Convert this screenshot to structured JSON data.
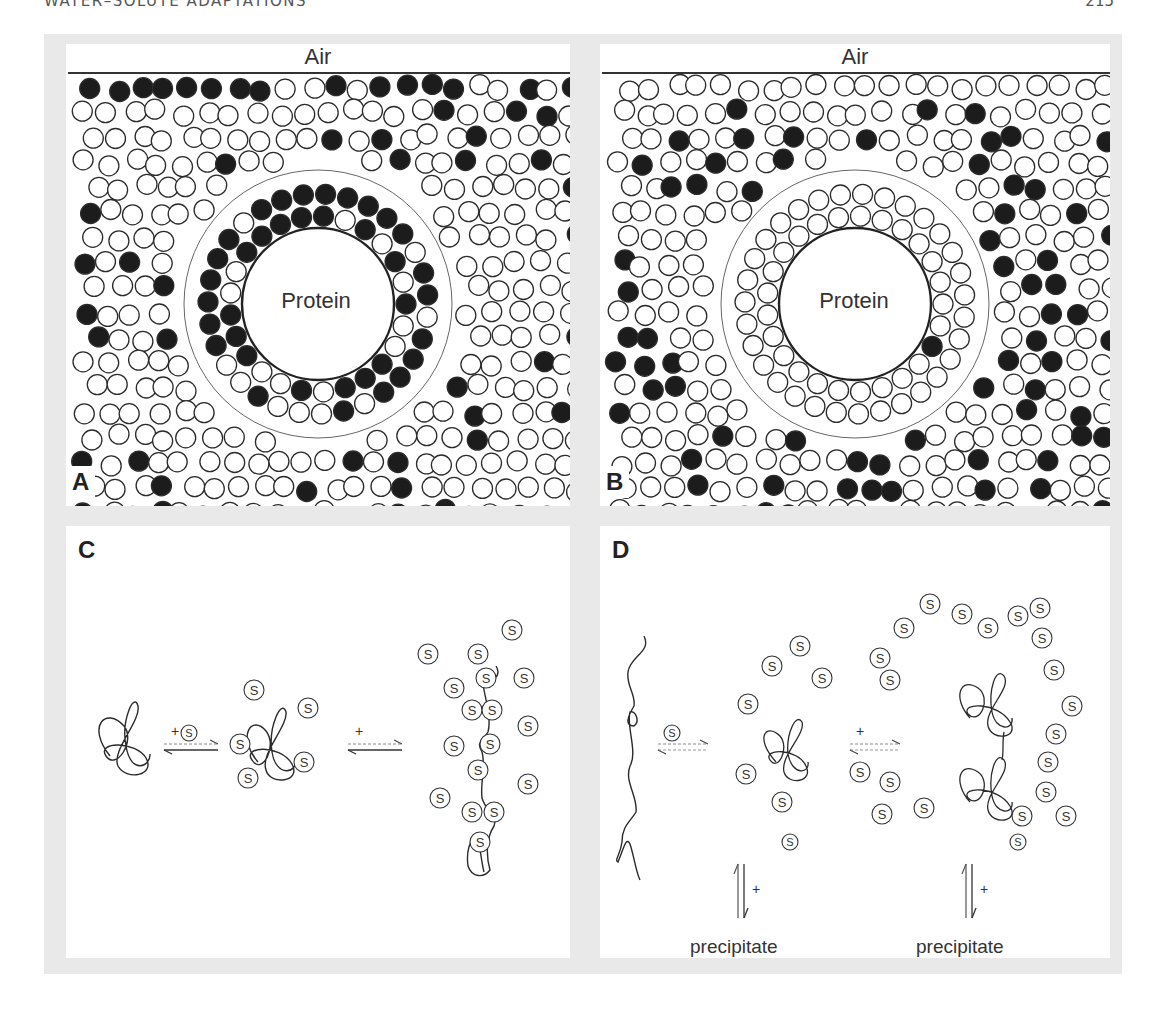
{
  "page": {
    "running_header": "WATER–SOLUTE ADAPTATIONS",
    "page_number": "215"
  },
  "figure": {
    "panels": [
      {
        "letter": "A",
        "top_label": "Air",
        "center_label": "Protein",
        "description": "Solute (filled) concentrated in protein hydration shell; excluded from bulk near air interface variably"
      },
      {
        "letter": "B",
        "top_label": "Air",
        "center_label": "Protein",
        "description": "Solute (filled) excluded from protein hydration shell and air interface"
      },
      {
        "letter": "C",
        "reaction": {
          "step1_label": "+",
          "step2_label": "+",
          "solute_symbol": "S"
        }
      },
      {
        "letter": "D",
        "reaction": {
          "step1_label": "+",
          "step2_label": "+",
          "solute_symbol": "S"
        },
        "precipitate_label": "precipitate",
        "precipitate_step_label": "+"
      }
    ],
    "legend": {
      "solute": "filled circle",
      "water": "open circle",
      "solute_symbol": "S"
    }
  },
  "colors": {
    "filled": "#1c1c1c",
    "stroke": "#2b2b2b",
    "frame": "#e9e9e9"
  }
}
